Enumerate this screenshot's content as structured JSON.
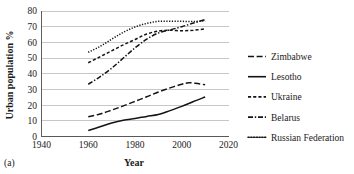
{
  "figure": {
    "panel_label": "(a)",
    "background": "#ffffff",
    "ink_color": "#141414",
    "grid_color": "#b9b9b9"
  },
  "chart_data": {
    "type": "line",
    "title": "",
    "xlabel": "Year",
    "ylabel": "Urban population %",
    "xlim": [
      1940,
      2020
    ],
    "ylim": [
      0,
      80
    ],
    "xticks": [
      1940,
      1960,
      1980,
      2000,
      2020
    ],
    "yticks": [
      0,
      10,
      20,
      30,
      40,
      50,
      60,
      70,
      80
    ],
    "grid": "horizontal",
    "legend_position": "right",
    "series": [
      {
        "name": "Zimbabwe",
        "dash": "dash-long",
        "x": [
          1960,
          1965,
          1970,
          1975,
          1980,
          1985,
          1990,
          1995,
          2000,
          2003,
          2006,
          2010
        ],
        "values": [
          12.6,
          14.3,
          16.8,
          19.5,
          22.4,
          25.3,
          28.4,
          31.0,
          33.3,
          34.2,
          33.9,
          33.0
        ]
      },
      {
        "name": "Lesotho",
        "dash": "solid",
        "x": [
          1960,
          1965,
          1970,
          1975,
          1980,
          1985,
          1990,
          1995,
          2000,
          2005,
          2010
        ],
        "values": [
          3.8,
          6.2,
          8.6,
          10.4,
          11.5,
          12.8,
          14.0,
          16.5,
          19.2,
          22.3,
          25.2
        ]
      },
      {
        "name": "Ukraine",
        "dash": "dash-short",
        "x": [
          1960,
          1965,
          1970,
          1975,
          1980,
          1985,
          1990,
          1995,
          2000,
          2005,
          2010
        ],
        "values": [
          47.0,
          50.8,
          54.6,
          58.4,
          61.8,
          65.3,
          67.2,
          67.7,
          67.4,
          67.8,
          68.6
        ]
      },
      {
        "name": "Belarus",
        "dash": "dash-dot",
        "x": [
          1960,
          1965,
          1970,
          1975,
          1980,
          1985,
          1990,
          1995,
          2000,
          2005,
          2010
        ],
        "values": [
          33.3,
          38.0,
          43.5,
          50.0,
          56.5,
          62.0,
          66.0,
          68.0,
          70.0,
          72.3,
          74.5
        ]
      },
      {
        "name": "Russian Federation",
        "dash": "dotted",
        "x": [
          1960,
          1965,
          1970,
          1975,
          1980,
          1985,
          1990,
          1995,
          2000,
          2005,
          2010
        ],
        "values": [
          53.7,
          57.4,
          62.0,
          66.4,
          69.8,
          72.1,
          73.4,
          73.4,
          73.4,
          73.3,
          73.7
        ]
      }
    ]
  },
  "legend": {
    "entries": [
      {
        "label": "Zimbabwe",
        "dash": "dash-long"
      },
      {
        "label": "Lesotho",
        "dash": "solid"
      },
      {
        "label": "Ukraine",
        "dash": "dash-short"
      },
      {
        "label": "Belarus",
        "dash": "dash-dot"
      },
      {
        "label": "Russian Federation",
        "dash": "dotted"
      }
    ]
  }
}
